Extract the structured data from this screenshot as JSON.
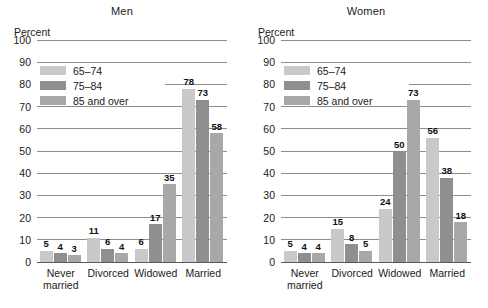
{
  "chart_data": [
    {
      "type": "bar",
      "title": "Men",
      "ylabel": "Percent",
      "xlabel": "",
      "ylim": [
        0,
        100
      ],
      "yticks": [
        0,
        10,
        20,
        30,
        40,
        50,
        60,
        70,
        80,
        90,
        100
      ],
      "grid": true,
      "legend_position": "upper left",
      "categories": [
        "Never\nmarried",
        "Divorced",
        "Widowed",
        "Married"
      ],
      "series": [
        {
          "name": "65–74",
          "color": "#c9c9c9",
          "values": [
            5,
            11,
            6,
            78
          ]
        },
        {
          "name": "75–84",
          "color": "#8f8f8f",
          "values": [
            4,
            6,
            17,
            73
          ]
        },
        {
          "name": "85 and over",
          "color": "#a8a8a8",
          "values": [
            3,
            4,
            35,
            58
          ]
        }
      ]
    },
    {
      "type": "bar",
      "title": "Women",
      "ylabel": "Percent",
      "xlabel": "",
      "ylim": [
        0,
        100
      ],
      "yticks": [
        0,
        10,
        20,
        30,
        40,
        50,
        60,
        70,
        80,
        90,
        100
      ],
      "grid": true,
      "legend_position": "upper left",
      "categories": [
        "Never\nmarried",
        "Divorced",
        "Widowed",
        "Married"
      ],
      "series": [
        {
          "name": "65–74",
          "color": "#c9c9c9",
          "values": [
            5,
            15,
            24,
            56
          ]
        },
        {
          "name": "75–84",
          "color": "#8f8f8f",
          "values": [
            4,
            8,
            50,
            38
          ]
        },
        {
          "name": "85 and over",
          "color": "#a8a8a8",
          "values": [
            4,
            5,
            73,
            18
          ]
        }
      ]
    }
  ],
  "colors": {
    "series_65_74": "#c9c9c9",
    "series_75_84": "#8f8f8f",
    "series_85_over": "#a8a8a8",
    "gridline": "#8d8d8d",
    "axis": "#5a5a5a",
    "text": "#1a1a1a",
    "background": "#ffffff"
  }
}
